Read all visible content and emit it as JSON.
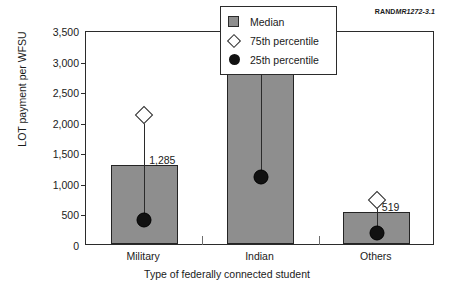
{
  "source_label": {
    "org": "RAND",
    "code": "MR1272-3.1"
  },
  "chart_data": {
    "type": "bar",
    "title": "",
    "xlabel": "Type of federally connected student",
    "ylabel": "LOT payment per WFSU",
    "categories": [
      "Military",
      "Indian",
      "Others"
    ],
    "ylim": [
      0,
      3500
    ],
    "yticks": [
      0,
      500,
      1000,
      1500,
      2000,
      2500,
      3000,
      3500
    ],
    "ytick_labels": [
      "0",
      "500",
      "1,000",
      "1,500",
      "2,000",
      "2,500",
      "3,000",
      "3,500"
    ],
    "grid": false,
    "legend_position": "upper right",
    "series": [
      {
        "name": "Median",
        "marker": "bar",
        "color": "#8e8e8e",
        "values": [
          1285,
          2898,
          519
        ],
        "value_labels": [
          "1,285",
          "2,898",
          "519"
        ]
      },
      {
        "name": "75th percentile",
        "marker": "diamond",
        "color": "#ffffff",
        "values": [
          2210,
          3040,
          830
        ]
      },
      {
        "name": "25th percentile",
        "marker": "circle",
        "color": "#111111",
        "values": [
          515,
          1220,
          300
        ]
      }
    ]
  },
  "legend": {
    "items": [
      {
        "label": "Median",
        "swatch": "square-icon"
      },
      {
        "label": "75th percentile",
        "swatch": "diamond-icon"
      },
      {
        "label": "25th percentile",
        "swatch": "circle-icon"
      }
    ]
  }
}
